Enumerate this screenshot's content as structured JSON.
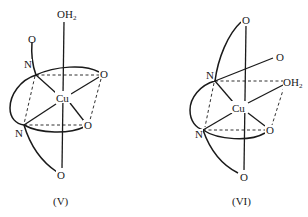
{
  "diagrams": [
    {
      "caption": "(V)",
      "center": "Cu",
      "atoms": {
        "axial_top": {
          "label": "OH",
          "sub": "2"
        },
        "pendant_o": "O",
        "n_upper": "N",
        "o_upper_right": "O",
        "n_lower": "N",
        "o_lower_right": "O",
        "axial_bottom": "O"
      }
    },
    {
      "caption": "(VI)",
      "center": "Cu",
      "atoms": {
        "axial_top": "O",
        "o_upper_right": "O",
        "n_upper": "N",
        "equatorial_water": {
          "label": "OH",
          "sub": "2"
        },
        "n_lower": "N",
        "o_lower_right": "O",
        "axial_bottom": "O"
      }
    }
  ]
}
